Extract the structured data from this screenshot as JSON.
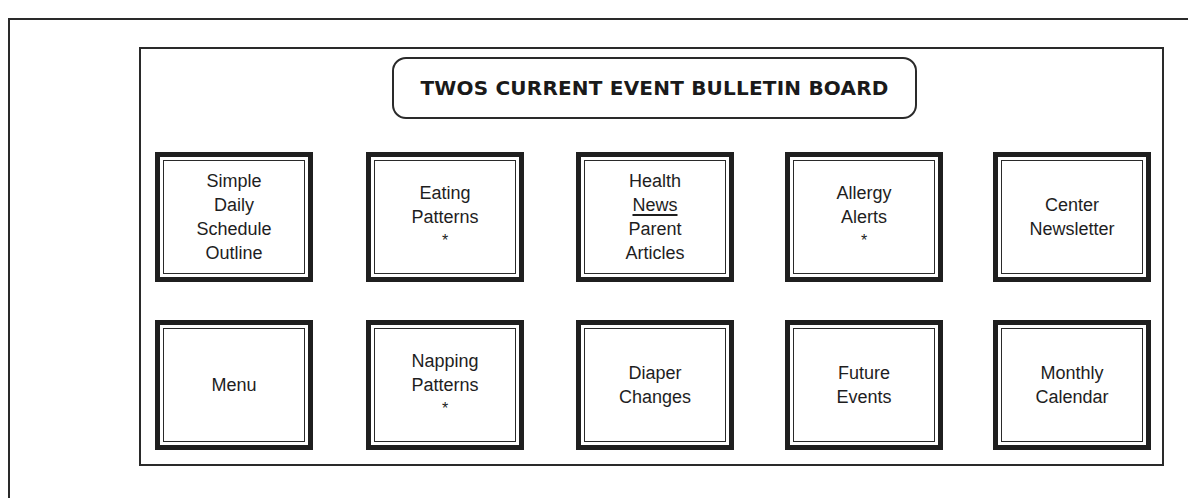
{
  "board": {
    "title": "TWOS CURRENT EVENT BULLETIN BOARD"
  },
  "cards": [
    {
      "id": "simple-daily-schedule-outline",
      "lines": [
        "Simple",
        "Daily",
        "Schedule",
        "Outline"
      ],
      "asterisk": false
    },
    {
      "id": "eating-patterns",
      "lines": [
        "Eating",
        "Patterns"
      ],
      "asterisk": true
    },
    {
      "id": "health-news-parent-articles",
      "lines": [
        "Health",
        "News",
        "Parent",
        "Articles"
      ],
      "underline_index": 1,
      "asterisk": false
    },
    {
      "id": "allergy-alerts",
      "lines": [
        "Allergy",
        "Alerts"
      ],
      "asterisk": true
    },
    {
      "id": "center-newsletter",
      "lines": [
        "Center",
        "Newsletter"
      ],
      "asterisk": false
    },
    {
      "id": "menu",
      "lines": [
        "Menu"
      ],
      "asterisk": false
    },
    {
      "id": "napping-patterns",
      "lines": [
        "Napping",
        "Patterns"
      ],
      "asterisk": true
    },
    {
      "id": "diaper-changes",
      "lines": [
        "Diaper",
        "Changes"
      ],
      "asterisk": false
    },
    {
      "id": "future-events",
      "lines": [
        "Future",
        "Events"
      ],
      "asterisk": false
    },
    {
      "id": "monthly-calendar",
      "lines": [
        "Monthly",
        "Calendar"
      ],
      "asterisk": false
    }
  ],
  "asterisk_symbol": "*"
}
